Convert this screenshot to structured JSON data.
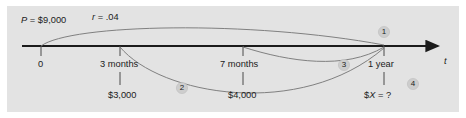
{
  "figure": {
    "panel_color": "#e3e3e3",
    "axis_color": "#1b1b1b",
    "arc_color": "#6e6e6e",
    "tick_color": "#4a4a4a",
    "badge_color": "#cfcfcf",
    "text_color": "#1b1b1b"
  },
  "axis": {
    "name": "time-axis",
    "label": "t",
    "arrow": "right-arrowhead"
  },
  "parameters": {
    "principal_label": "P = $9,000",
    "principal_symbol": "P",
    "principal_value": "$9,000",
    "rate_label": "r = .04",
    "rate_symbol": "r",
    "rate_value": ".04"
  },
  "ticks": [
    {
      "name": "tick-0",
      "label": "0",
      "x": 41,
      "amount": null
    },
    {
      "name": "tick-3-months",
      "label": "3 months",
      "x": 120,
      "amount": "$3,000"
    },
    {
      "name": "tick-7-months",
      "label": "7 months",
      "x": 243,
      "amount": "$4,000"
    },
    {
      "name": "tick-1-year",
      "label": "1 year",
      "x": 384,
      "amount": "$X = ?"
    }
  ],
  "amounts": {
    "at_3_months": "$3,000",
    "at_7_months": "$4,000",
    "at_1_year": "$X = ?",
    "unknown_symbol": "X"
  },
  "badges": [
    {
      "name": "badge-1",
      "label": "1",
      "x": 384,
      "y": 33
    },
    {
      "name": "badge-2",
      "label": "2",
      "x": 182,
      "y": 89
    },
    {
      "name": "badge-3",
      "label": "3",
      "x": 344,
      "y": 66
    },
    {
      "name": "badge-4",
      "label": "4",
      "x": 413,
      "y": 85
    }
  ],
  "arcs": [
    {
      "name": "arc-1-principal-to-1-year",
      "from": "0",
      "to": "1 year",
      "side": "above",
      "badge": "1"
    },
    {
      "name": "arc-2-3-months-to-1-year",
      "from": "3 months",
      "to": "1 year",
      "side": "below",
      "badge": "2"
    },
    {
      "name": "arc-3-7-months-to-1-year",
      "from": "7 months",
      "to": "1 year",
      "side": "below",
      "badge": "3"
    }
  ]
}
